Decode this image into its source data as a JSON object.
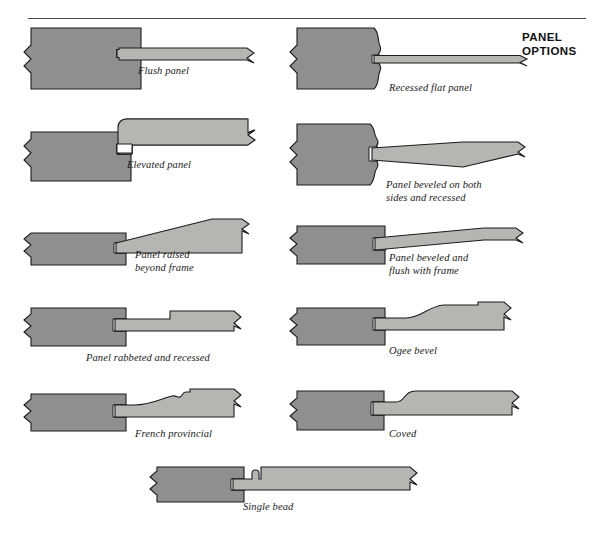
{
  "document": {
    "heading": "PANEL\nOPTIONS",
    "heading_lines": [
      "PANEL",
      "OPTIONS"
    ],
    "divider": true
  },
  "colors": {
    "frame_fill": "#8f8f8f",
    "panel_fill": "#b5b5b1",
    "panel_fill_light": "#c2c2be",
    "outline": "#1c1c1c",
    "groove_fill": "#ffffff",
    "page_background": "#ffffff",
    "rule": "#4a4a4a",
    "text": "#1a1a1a"
  },
  "figures": [
    {
      "id": "flush-panel",
      "caption": "Flush panel",
      "column": "left",
      "row": 1,
      "frame_profile": "square",
      "panel_profile": "flat-flush",
      "description": "Panel face is flush with the front of the frame"
    },
    {
      "id": "recessed-flat-panel",
      "caption": "Recessed flat panel",
      "column": "right",
      "row": 1,
      "frame_profile": "ogee-molded",
      "panel_profile": "flat-thin-recessed",
      "description": "Thin flat panel set back behind a molded frame edge"
    },
    {
      "id": "elevated-panel",
      "caption": "Elevated panel",
      "column": "left",
      "row": 2,
      "frame_profile": "square",
      "panel_profile": "flat-raised-above-frame",
      "description": "Flat panel stands proud of the frame face"
    },
    {
      "id": "panel-beveled-both-sides-recessed",
      "caption": "Panel beveled on both\nsides and recessed",
      "caption_lines": [
        "Panel beveled on both",
        "sides and recessed"
      ],
      "column": "right",
      "row": 2,
      "frame_profile": "ogee-molded",
      "panel_profile": "double-bevel",
      "description": "Panel tapers on both faces toward the groove"
    },
    {
      "id": "panel-raised-beyond-frame",
      "caption": "Panel raised\nbeyond frame",
      "caption_lines": [
        "Panel raised",
        "beyond frame"
      ],
      "column": "left",
      "row": 3,
      "frame_profile": "square",
      "panel_profile": "bevel-raised-above",
      "description": "Beveled panel rises above the frame surface"
    },
    {
      "id": "panel-beveled-flush-with-frame",
      "caption": "Panel beveled and\nflush with frame",
      "caption_lines": [
        "Panel beveled and",
        "flush with frame"
      ],
      "column": "right",
      "row": 3,
      "frame_profile": "square",
      "panel_profile": "bevel-flush",
      "description": "Beveled panel finishes level with the frame face"
    },
    {
      "id": "panel-rabbeted-and-recessed",
      "caption": "Panel rabbeted and recessed",
      "column": "left",
      "row": 4,
      "frame_profile": "square",
      "panel_profile": "rabbeted-step",
      "description": "Panel shoulder is rabbeted so the field sits recessed"
    },
    {
      "id": "ogee-bevel",
      "caption": "Ogee bevel",
      "column": "right",
      "row": 4,
      "frame_profile": "square",
      "panel_profile": "ogee-bevel",
      "description": "S-curve ogee shape worked into the panel edge"
    },
    {
      "id": "french-provincial",
      "caption": "French provincial",
      "column": "left",
      "row": 5,
      "frame_profile": "square",
      "panel_profile": "french-provincial",
      "description": "Stepped and curved decorative raised panel edge"
    },
    {
      "id": "coved",
      "caption": "Coved",
      "column": "right",
      "row": 5,
      "frame_profile": "square",
      "panel_profile": "coved",
      "description": "Concave cove curve at the panel shoulder"
    },
    {
      "id": "single-bead",
      "caption": "Single bead",
      "column": "center",
      "row": 6,
      "frame_profile": "square",
      "panel_profile": "single-bead",
      "description": "One small bead run along the edge of the panel"
    }
  ]
}
